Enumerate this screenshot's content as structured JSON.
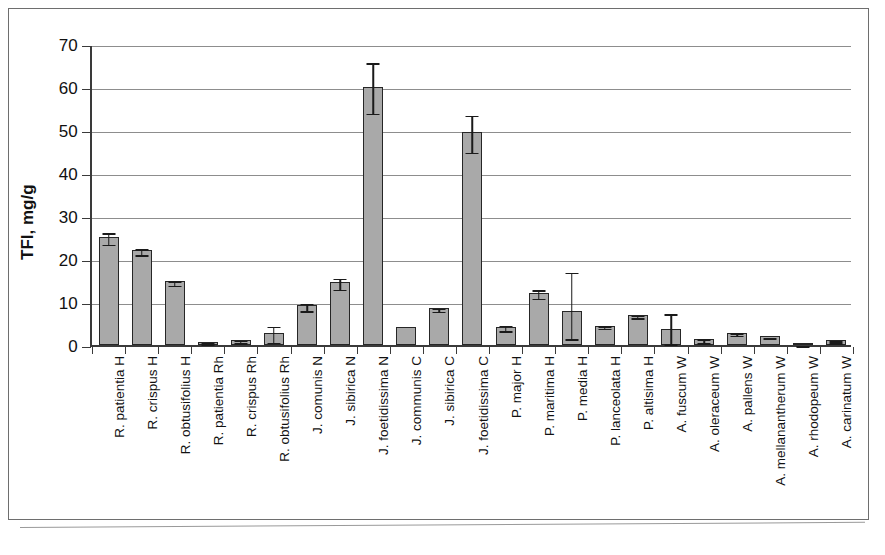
{
  "chart_data": {
    "type": "bar",
    "title": "",
    "xlabel": "",
    "ylabel": "TFI, mg/g",
    "ylim": [
      0,
      70
    ],
    "yticks": [
      0,
      10,
      20,
      30,
      40,
      50,
      60,
      70
    ],
    "grid": true,
    "legend": "none",
    "error_bars": "present",
    "categories": [
      "R. patientia H",
      "R. crispus H",
      "R. obtusifolius H",
      "R. patientia Rh",
      "R. crispus Rh",
      "R. obtusifolius Rh",
      "J. comunis N",
      "J. sibirica N",
      "J. foetidissima N",
      "J. communis C",
      "J. sibirica C",
      "J. foetidissima C",
      "P. major H",
      "P. maritima H",
      "P. media H",
      "P. lanceolata H",
      "P. altisima H",
      "A. fuscum W",
      "A. oleraceum W",
      "A. pallens W",
      "A. mellanantherum W",
      "A. rhodopeum W",
      "A. carinatum W"
    ],
    "values": [
      25.1,
      22.0,
      14.8,
      0.8,
      1.2,
      2.8,
      9.2,
      14.6,
      60.0,
      4.2,
      8.5,
      49.5,
      4.3,
      12.2,
      8.0,
      4.5,
      7.0,
      3.7,
      1.3,
      2.9,
      2.0,
      0.2,
      1.1
    ],
    "err_low": [
      23.8,
      21.3,
      14.3,
      0.6,
      0.9,
      1.0,
      8.3,
      13.3,
      54.2,
      4.2,
      8.2,
      45.2,
      3.7,
      11.2,
      1.8,
      4.2,
      6.7,
      0.6,
      0.9,
      2.6,
      1.9,
      0.2,
      0.9
    ],
    "err_high": [
      26.4,
      22.7,
      15.3,
      1.0,
      1.5,
      4.7,
      10.1,
      15.9,
      66.0,
      4.2,
      8.9,
      53.8,
      5.0,
      13.2,
      17.3,
      4.8,
      7.3,
      7.6,
      1.8,
      3.2,
      2.2,
      0.3,
      1.3
    ]
  },
  "axis": {
    "y_title": "TFI, mg/g",
    "tick_labels": [
      "70",
      "60",
      "50",
      "40",
      "30",
      "20",
      "10",
      "0"
    ]
  },
  "colors": {
    "bar_fill": "#a9a9a9",
    "bar_stroke": "#262626",
    "gridline": "#8d8d8d",
    "axis": "#3a3a3a",
    "text": "#111111",
    "frame": "#6e6e6e",
    "background": "#ffffff"
  }
}
